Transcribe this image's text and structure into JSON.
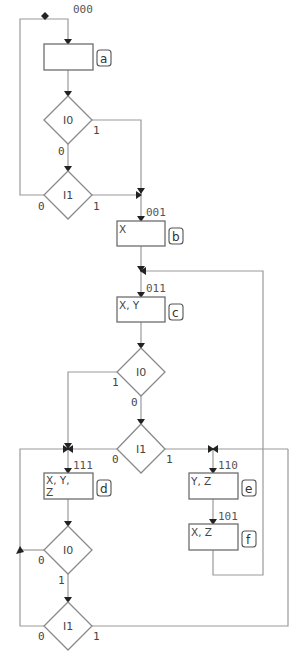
{
  "diagram": {
    "states": [
      {
        "id": "a",
        "code": "000",
        "outputs": [
          "",
          ""
        ]
      },
      {
        "id": "b",
        "code": "001",
        "outputs": [
          "X",
          ""
        ]
      },
      {
        "id": "c",
        "code": "011",
        "outputs": [
          "X, Y",
          ""
        ]
      },
      {
        "id": "d",
        "code": "111",
        "outputs": [
          "X, Y,",
          "Z"
        ]
      },
      {
        "id": "e",
        "code": "110",
        "outputs": [
          "Y, Z",
          ""
        ]
      },
      {
        "id": "f",
        "code": "101",
        "outputs": [
          "X, Z",
          ""
        ]
      }
    ],
    "decisions": [
      {
        "id": "a_I0",
        "label": "I0",
        "branch_right": "1",
        "branch_bottom": "0"
      },
      {
        "id": "a_I1",
        "label": "I1",
        "branch_left": "0",
        "branch_right": "1"
      },
      {
        "id": "c_I0",
        "label": "I0",
        "branch_left": "1",
        "branch_bottom": "0"
      },
      {
        "id": "c_I1",
        "label": "I1",
        "branch_left": "0",
        "branch_right": "1"
      },
      {
        "id": "d_I0",
        "label": "I0",
        "branch_left": "0",
        "branch_bottom": "1"
      },
      {
        "id": "d_I1",
        "label": "I1",
        "branch_left": "0",
        "branch_right": "1"
      }
    ],
    "colors": {
      "line": "#9a9a9a",
      "box": "#6e6e6e",
      "arrow": "#222222"
    }
  }
}
